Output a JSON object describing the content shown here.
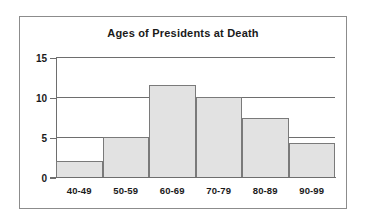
{
  "chart_data": {
    "type": "bar",
    "title": "Ages of Presidents at Death",
    "xlabel": "",
    "ylabel": "",
    "categories": [
      "40-49",
      "50-59",
      "60-69",
      "70-79",
      "80-89",
      "90-99"
    ],
    "values": [
      2,
      5,
      11.5,
      10,
      7.4,
      4.3
    ],
    "ylim": [
      0,
      15
    ],
    "yticks": [
      0,
      5,
      10,
      15
    ],
    "ytick_labels": [
      "0",
      "5",
      "10",
      "15"
    ],
    "grid": true,
    "legend": false,
    "legend_position": "none",
    "bar_fill_color": "#e2e2e2",
    "bar_edge_color": "#7a7a7a",
    "axis_color": "#6e6e6e",
    "text_color": "#1a1a1a",
    "background_color": "#ffffff",
    "frame_color": "#8c8c8c"
  }
}
